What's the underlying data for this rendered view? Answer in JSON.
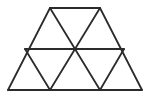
{
  "figure": {
    "title": "Trapezoid subdivided into nine congruent equilateral triangles",
    "shape_type": "geometric-line-figure",
    "background_color": "#ffffff",
    "line_color": "#2b2b2b",
    "line_width": 1.8,
    "canvas": {
      "width": 149,
      "height": 102
    },
    "triangle_count_total": 9,
    "row_counts": {
      "upper_row": 3,
      "lower_row": 6
    },
    "vertices": [
      {
        "id": "A",
        "name": "bottom-left-corner",
        "x": 8,
        "y": 90
      },
      {
        "id": "B",
        "name": "bottom-mid-left",
        "x": 50,
        "y": 90
      },
      {
        "id": "C",
        "name": "bottom-mid-right",
        "x": 100,
        "y": 90
      },
      {
        "id": "D",
        "name": "bottom-right-corner",
        "x": 142,
        "y": 90
      },
      {
        "id": "E",
        "name": "middle-left",
        "x": 25,
        "y": 49
      },
      {
        "id": "F",
        "name": "middle-center",
        "x": 75,
        "y": 49
      },
      {
        "id": "G",
        "name": "middle-right",
        "x": 124,
        "y": 49
      },
      {
        "id": "H",
        "name": "top-left",
        "x": 50,
        "y": 8
      },
      {
        "id": "I",
        "name": "top-right",
        "x": 100,
        "y": 8
      }
    ],
    "segments": [
      {
        "id": "s1",
        "name": "bottom-edge",
        "from": "A",
        "to": "D",
        "kind": "outline"
      },
      {
        "id": "s2",
        "name": "top-edge",
        "from": "H",
        "to": "I",
        "kind": "outline"
      },
      {
        "id": "s3",
        "name": "left-slant-edge",
        "from": "A",
        "to": "H",
        "kind": "outline"
      },
      {
        "id": "s4",
        "name": "right-slant-edge",
        "from": "D",
        "to": "I",
        "kind": "outline"
      },
      {
        "id": "s5",
        "name": "middle-horizontal",
        "from": "E",
        "to": "G",
        "kind": "internal"
      },
      {
        "id": "s6",
        "name": "internal-slant-left-up",
        "from": "E",
        "to": "B",
        "kind": "internal"
      },
      {
        "id": "s7",
        "name": "internal-slant-center-left",
        "from": "B",
        "to": "F",
        "kind": "internal"
      },
      {
        "id": "s8",
        "name": "internal-slant-center-right",
        "from": "F",
        "to": "C",
        "kind": "internal"
      },
      {
        "id": "s9",
        "name": "internal-slant-right-down",
        "from": "C",
        "to": "G",
        "kind": "internal"
      },
      {
        "id": "s10",
        "name": "internal-slant-upper-left",
        "from": "H",
        "to": "F",
        "kind": "internal"
      },
      {
        "id": "s11",
        "name": "internal-slant-upper-right",
        "from": "F",
        "to": "I",
        "kind": "internal"
      }
    ]
  }
}
